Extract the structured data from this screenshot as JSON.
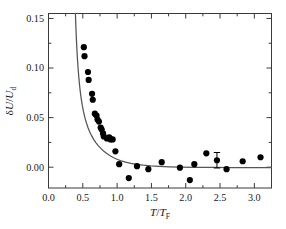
{
  "chart_data": {
    "type": "scatter",
    "title": "",
    "xlabel": "T/T_F",
    "ylabel": "δU/U_d",
    "xlabel_parts": {
      "num": "T",
      "den": "T",
      "den_sub": "F"
    },
    "ylabel_parts": {
      "num_sym": "δ",
      "num": "U",
      "den": "U",
      "den_sub": "d"
    },
    "xlim": [
      0.0,
      3.25
    ],
    "ylim": [
      -0.021,
      0.155
    ],
    "xticks": [
      0.0,
      0.5,
      1.0,
      1.5,
      2.0,
      2.5,
      3.0
    ],
    "xticklabels": [
      "0.0",
      "0.5",
      "1.0",
      "1.5",
      "2.0",
      "2.5",
      "3.0"
    ],
    "xminorticks": [
      0.25,
      0.75,
      1.25,
      1.75,
      2.25,
      2.75,
      3.25
    ],
    "yticks": [
      0.0,
      0.05,
      0.1,
      0.15
    ],
    "yticklabels": [
      "0.00",
      "0.05",
      "0.10",
      "0.15"
    ],
    "yminorticks": [
      -0.025,
      0.025,
      0.075,
      0.125
    ],
    "grid": false,
    "legend": null,
    "marker": {
      "shape": "circle",
      "color": "#000000",
      "size": 3.1
    },
    "series": [
      {
        "name": "measured data",
        "type": "scatter",
        "points": [
          [
            0.515,
            0.121
          ],
          [
            0.525,
            0.112
          ],
          [
            0.575,
            0.096
          ],
          [
            0.585,
            0.088
          ],
          [
            0.635,
            0.074
          ],
          [
            0.645,
            0.068
          ],
          [
            0.675,
            0.054
          ],
          [
            0.7,
            0.052
          ],
          [
            0.715,
            0.048
          ],
          [
            0.735,
            0.046
          ],
          [
            0.76,
            0.04
          ],
          [
            0.775,
            0.038
          ],
          [
            0.795,
            0.034
          ],
          [
            0.805,
            0.031
          ],
          [
            0.85,
            0.029
          ],
          [
            0.885,
            0.03
          ],
          [
            0.905,
            0.028
          ],
          [
            0.935,
            0.028
          ],
          [
            0.975,
            0.016
          ],
          [
            1.03,
            0.003
          ],
          [
            1.17,
            -0.011
          ],
          [
            1.29,
            0.001
          ],
          [
            1.455,
            -0.002
          ],
          [
            1.65,
            0.005
          ],
          [
            1.915,
            -0.0005
          ],
          [
            2.06,
            -0.013
          ],
          [
            2.125,
            0.003
          ],
          [
            2.3,
            0.014
          ],
          [
            2.455,
            0.007
          ],
          [
            2.595,
            -0.002
          ],
          [
            2.83,
            0.006
          ],
          [
            3.09,
            0.01
          ]
        ]
      },
      {
        "name": "theory curve",
        "type": "line",
        "color": "#555555",
        "points": [
          [
            0.392,
            0.155
          ],
          [
            0.4,
            0.14
          ],
          [
            0.41,
            0.124
          ],
          [
            0.42,
            0.111
          ],
          [
            0.432,
            0.099
          ],
          [
            0.445,
            0.088
          ],
          [
            0.46,
            0.078
          ],
          [
            0.475,
            0.07
          ],
          [
            0.492,
            0.0625
          ],
          [
            0.51,
            0.056
          ],
          [
            0.53,
            0.05
          ],
          [
            0.552,
            0.0448
          ],
          [
            0.575,
            0.04
          ],
          [
            0.6,
            0.0358
          ],
          [
            0.628,
            0.0318
          ],
          [
            0.658,
            0.028
          ],
          [
            0.69,
            0.0248
          ],
          [
            0.725,
            0.0218
          ],
          [
            0.762,
            0.019
          ],
          [
            0.802,
            0.0164
          ],
          [
            0.845,
            0.014
          ],
          [
            0.892,
            0.0118
          ],
          [
            0.942,
            0.0098
          ],
          [
            0.998,
            0.008
          ],
          [
            1.058,
            0.0064
          ],
          [
            1.125,
            0.005
          ],
          [
            1.2,
            0.0038
          ],
          [
            1.285,
            0.0028
          ],
          [
            1.38,
            0.002
          ],
          [
            1.49,
            0.0013
          ],
          [
            1.615,
            0.0008
          ],
          [
            1.76,
            0.0004
          ],
          [
            1.93,
            0.0001
          ],
          [
            2.13,
            -0.0001
          ],
          [
            2.38,
            -0.0003
          ],
          [
            2.7,
            -0.0004
          ],
          [
            3.1,
            -0.0005
          ],
          [
            3.25,
            -0.0005
          ]
        ]
      }
    ],
    "errorbars": [
      {
        "x": 2.455,
        "y": 0.007,
        "yerr": 0.0078
      }
    ]
  }
}
